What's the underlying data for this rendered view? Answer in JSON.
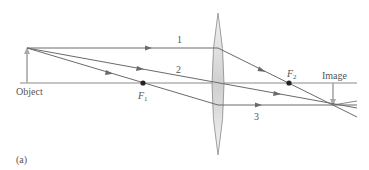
{
  "figure": {
    "panel_label": "(a)",
    "object_label": "Object",
    "image_label": "Image",
    "focal_points": [
      {
        "name": "F",
        "sub": "1"
      },
      {
        "name": "F",
        "sub": "2"
      }
    ],
    "rays": [
      {
        "label": "1"
      },
      {
        "label": "2"
      },
      {
        "label": "3"
      }
    ],
    "colors": {
      "ray": "#6a6a6a",
      "axis": "#8a8a8a",
      "arrow": "#a8a8a8",
      "lens_fill": "#d8d8d8",
      "focal_dot": "#222222",
      "text": "#555555"
    }
  }
}
